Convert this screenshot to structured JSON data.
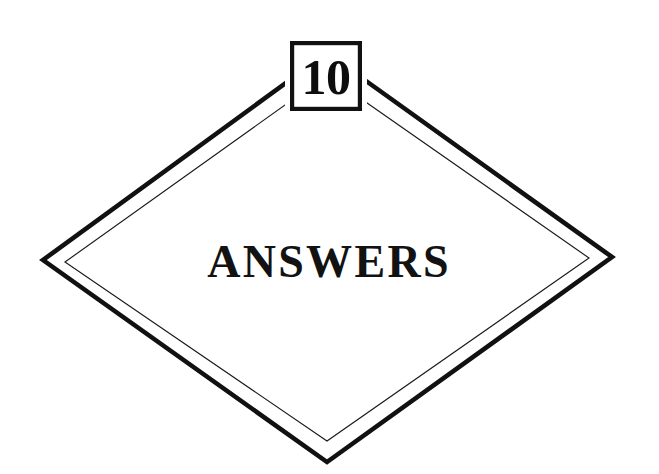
{
  "page": {
    "kind": "chapter-divider",
    "background_color": "#ffffff",
    "ink_color": "#111111",
    "width": 659,
    "height": 474
  },
  "chapter": {
    "number": "10",
    "title": "ANSWERS"
  },
  "number_box": {
    "label": "10",
    "fill_color": "#ffffff",
    "border_color": "#111111",
    "x": 290,
    "y": 41,
    "width": 72,
    "height": 70
  },
  "diamond": {
    "outer": {
      "stroke_color": "#111111",
      "stroke_width": 4.6,
      "points": "327,53 612,257 327,462 43,260"
    },
    "inner": {
      "stroke_color": "#1a1a1a",
      "stroke_width": 1.15,
      "points": "327,75 589,258 327,441 65,262"
    }
  },
  "title_block": {
    "text": "ANSWERS",
    "x": 329,
    "baseline_y": 277,
    "color": "#121212"
  }
}
